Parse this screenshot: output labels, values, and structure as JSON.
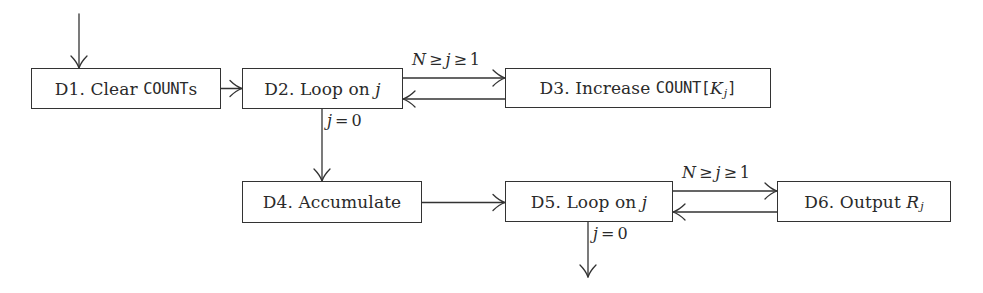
{
  "diagram": {
    "title": "",
    "type": "flowchart",
    "nodes": [
      {
        "id": "D1",
        "prefix": "D1. Clear ",
        "code": "COUNT",
        "suffix": "s",
        "full": "D1. Clear COUNTs"
      },
      {
        "id": "D2",
        "prefix": "D2. Loop on ",
        "var": "j",
        "full": "D2. Loop on j"
      },
      {
        "id": "D3",
        "prefix": "D3. Increase ",
        "code": "COUNT[",
        "var": "K",
        "sub": "j",
        "code_close": "]",
        "full": "D3. Increase COUNT[K_j]"
      },
      {
        "id": "D4",
        "label": "D4. Accumulate",
        "full": "D4. Accumulate"
      },
      {
        "id": "D5",
        "prefix": "D5. Loop on ",
        "var": "j",
        "full": "D5. Loop on j"
      },
      {
        "id": "D6",
        "prefix": "D6. Output ",
        "var": "R",
        "sub": "j",
        "full": "D6. Output R_j"
      }
    ],
    "edge_labels": {
      "d2_d3": {
        "N": "N",
        "ge1": "≥",
        "j": "j",
        "ge2": "≥",
        "one": "1",
        "full": "N ≥ j ≥ 1"
      },
      "d2_d4": {
        "j": "j",
        "eq": "=",
        "zero": "0",
        "full": "j = 0"
      },
      "d5_d6": {
        "N": "N",
        "ge1": "≥",
        "j": "j",
        "ge2": "≥",
        "one": "1",
        "full": "N ≥ j ≥ 1"
      },
      "d5_exit": {
        "j": "j",
        "eq": "=",
        "zero": "0",
        "full": "j = 0"
      }
    },
    "edges": [
      {
        "from": "start",
        "to": "D1"
      },
      {
        "from": "D1",
        "to": "D2"
      },
      {
        "from": "D2",
        "to": "D3",
        "label": "N ≥ j ≥ 1"
      },
      {
        "from": "D3",
        "to": "D2"
      },
      {
        "from": "D2",
        "to": "D4",
        "label": "j = 0"
      },
      {
        "from": "D4",
        "to": "D5"
      },
      {
        "from": "D5",
        "to": "D6",
        "label": "N ≥ j ≥ 1"
      },
      {
        "from": "D6",
        "to": "D5"
      },
      {
        "from": "D5",
        "to": "exit",
        "label": "j = 0"
      }
    ],
    "colors": {
      "stroke": "#333333",
      "text": "#2a2a2a",
      "background": "#ffffff"
    }
  }
}
